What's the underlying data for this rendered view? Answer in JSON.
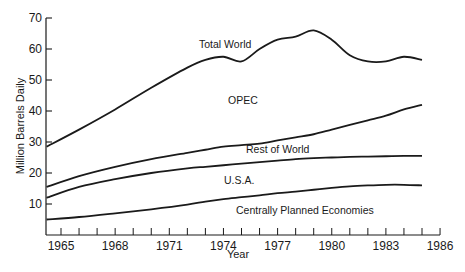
{
  "chart_data": {
    "type": "line",
    "title": "",
    "xlabel": "Year",
    "ylabel": "Million Barrels Daily",
    "xlim": [
      1964.2,
      1986
    ],
    "ylim": [
      0,
      70
    ],
    "grid": false,
    "legend": "inline labels",
    "x_ticks": [
      1965,
      1968,
      1971,
      1974,
      1977,
      1980,
      1983,
      1986
    ],
    "y_ticks": [
      10,
      20,
      30,
      40,
      50,
      60,
      70
    ],
    "x": [
      1964.2,
      1966,
      1968,
      1970,
      1972,
      1973,
      1974,
      1975,
      1976,
      1977,
      1978,
      1979,
      1980,
      1981,
      1982,
      1983,
      1984,
      1985
    ],
    "series": [
      {
        "name": "Total World",
        "values": [
          28.5,
          34,
          40.5,
          47.5,
          54,
          56.5,
          57.5,
          56,
          60,
          63,
          64,
          66,
          63,
          58,
          56,
          56,
          57.5,
          56.5
        ]
      },
      {
        "name": "OPEC / Rest of World boundary",
        "values": [
          15.5,
          19,
          22,
          24.5,
          26.5,
          27.5,
          28.5,
          29,
          29.5,
          30.5,
          31.5,
          32.5,
          34,
          35.5,
          37,
          38.5,
          40.5,
          42
        ]
      },
      {
        "name": "Rest of World / U.S.A. boundary",
        "values": [
          12,
          15.5,
          18,
          20,
          21.5,
          22,
          22.5,
          23,
          23.5,
          24,
          24.5,
          24.8,
          25,
          25.2,
          25.3,
          25.4,
          25.5,
          25.5
        ]
      },
      {
        "name": "U.S.A. / Centrally Planned Economies boundary",
        "values": [
          5,
          5.8,
          7,
          8.3,
          9.8,
          10.8,
          11.6,
          12.2,
          12.8,
          13.5,
          14,
          14.6,
          15.2,
          15.7,
          16,
          16.2,
          16.2,
          16
        ]
      }
    ],
    "region_labels": [
      "Total World",
      "OPEC",
      "Rest of World",
      "U.S.A.",
      "Centrally Planned Economies"
    ]
  },
  "labels": {
    "ylabel": "Million Barrels Daily",
    "xlabel": "Year",
    "total_world": "Total World",
    "opec": "OPEC",
    "rest_of_world": "Rest of World",
    "usa": "U.S.A.",
    "cpe": "Centrally Planned Economies"
  }
}
